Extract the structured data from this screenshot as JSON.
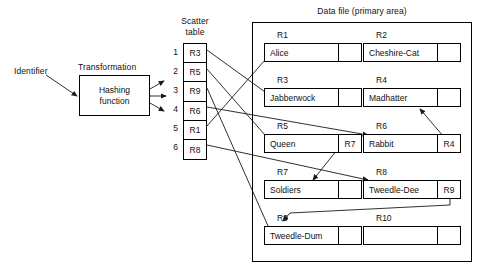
{
  "diagram": {
    "identifier_label": "Identifier",
    "transformation_label": "Transformation",
    "hash_box": {
      "line1": "Hashing",
      "line2": "function"
    },
    "scatter_table": {
      "title_line1": "Scatter",
      "title_line2": "table",
      "rows": [
        {
          "index": "1",
          "value": "R3"
        },
        {
          "index": "2",
          "value": "R5"
        },
        {
          "index": "3",
          "value": "R9"
        },
        {
          "index": "4",
          "value": "R6"
        },
        {
          "index": "5",
          "value": "R1"
        },
        {
          "index": "6",
          "value": "R8"
        }
      ]
    },
    "data_file": {
      "title": "Data file (primary area)",
      "rows": [
        {
          "left": {
            "tag": "R1",
            "name": "Alice",
            "pointer": ""
          },
          "right": {
            "tag": "R2",
            "name": "Cheshire-Cat",
            "pointer": ""
          }
        },
        {
          "left": {
            "tag": "R3",
            "name": "Jabberwock",
            "pointer": ""
          },
          "right": {
            "tag": "R4",
            "name": "Madhatter",
            "pointer": ""
          }
        },
        {
          "left": {
            "tag": "R5",
            "name": "Queen",
            "pointer": "R7"
          },
          "right": {
            "tag": "R6",
            "name": "Rabbit",
            "pointer": "R4"
          }
        },
        {
          "left": {
            "tag": "R7",
            "name": "Soldiers",
            "pointer": ""
          },
          "right": {
            "tag": "R8",
            "name": "Tweedle-Dee",
            "pointer": "R9"
          }
        },
        {
          "left": {
            "tag": "R9",
            "name": "Tweedle-Dum",
            "pointer": ""
          },
          "right": {
            "tag": "R10",
            "name": "",
            "pointer": ""
          }
        }
      ]
    },
    "colors": {
      "line": "#1a1a1a",
      "text": "#111111",
      "background": "#ffffff"
    }
  }
}
